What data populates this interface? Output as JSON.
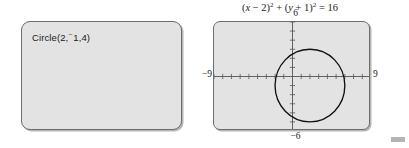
{
  "calculator": {
    "command_panel": {
      "command_prefix": "Circle(2,",
      "command_minus": "⁻",
      "command_suffix": "1,4)",
      "command_full": "Circle(2, -1,4)"
    },
    "graph_panel": {
      "equation": {
        "full": "(x - 2)^2 + (y + 1)^2 = 16",
        "lhs_open": "(",
        "var_x": "x",
        "op_minus": " − ",
        "num_h": "2",
        "close_sq": ")",
        "exp2": "2",
        "op_plus": " + ",
        "var_y": "y",
        "op_plus_inner": " + ",
        "num_k": "1",
        "equals": " = ",
        "rhs": "16"
      },
      "window": {
        "ymax_label": "6",
        "ymin_label": "−6",
        "xmin_label": "−9",
        "xmax_label": "9"
      }
    }
  },
  "chart_data": {
    "type": "scatter",
    "xlabel": "",
    "ylabel": "",
    "xlim": [
      -9,
      9
    ],
    "ylim": [
      -6,
      6
    ],
    "grid": false,
    "x_tick_step": 1,
    "y_tick_step": 1,
    "legend": "none",
    "shapes": [
      {
        "kind": "circle",
        "center_x": 2,
        "center_y": -1,
        "radius": 4,
        "stroke": "#111111",
        "fill": "none"
      }
    ],
    "annotations": [
      {
        "text": "6",
        "x": 0,
        "y": 6,
        "position": "above-axis-top"
      },
      {
        "text": "−6",
        "x": 0,
        "y": -6,
        "position": "below-axis-bottom"
      },
      {
        "text": "−9",
        "x": -9,
        "y": 0,
        "position": "left-of-axis"
      },
      {
        "text": "9",
        "x": 9,
        "y": 0,
        "position": "right-of-axis"
      }
    ]
  },
  "colors": {
    "panel_fill": "#e3e3e3",
    "panel_border": "#6d6d6d",
    "axis": "#555555",
    "curve": "#111111",
    "text": "#1a1a1a",
    "page_background": "#ffffff"
  }
}
